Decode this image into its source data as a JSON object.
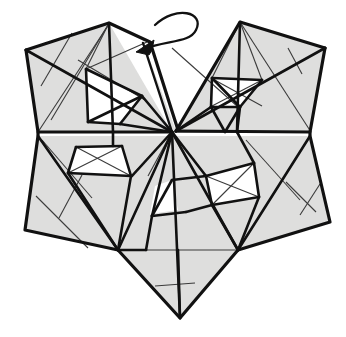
{
  "figure": {
    "kind": "crease-pattern-step",
    "canvas": {
      "width": 346,
      "height": 337
    },
    "colors": {
      "background": "#ffffff",
      "paper_front": "#dededd",
      "paper_pocket": "#ffffff",
      "line_major": "#111111",
      "line_minor": "#3a3a3a",
      "arrow": "#111111"
    },
    "stroke_widths": {
      "outline": 3.2,
      "major": 2.6,
      "minor": 1.1,
      "arrow": 2.4
    },
    "landmarks": {
      "center_vertex": "172,132",
      "left_corner": "26,50",
      "right_corner": "325,48",
      "top_left_peak": "109,23",
      "top_right_peak": "240,22",
      "bottom_left_corner": "25,230",
      "bottom_right_corner": "330,222",
      "bottom_point": "180,318"
    },
    "annotation": {
      "arrow_name": "fold-arrow",
      "arrow_meaning": "valley-fold-flap-left",
      "arrow_start": "186,14",
      "arrow_end": "138,50"
    },
    "shapes": {
      "facets": [
        {
          "name": "upper-left-outer-west",
          "points": "26,50 109,23 113,132 38,132"
        },
        {
          "name": "upper-left-outer-north",
          "points": "109,23 169,130 113,132"
        },
        {
          "name": "upper-left-fan-a",
          "points": "26,50 113,132 38,132"
        },
        {
          "name": "upper-left-inner-pocket-left",
          "points": "86,69 113,94 88,122"
        },
        {
          "name": "upper-left-inner-pocket-right",
          "points": "86,69 142,96 113,94"
        },
        {
          "name": "upper-left-pocket-lower",
          "points": "113,94 142,96 120,124 88,122"
        },
        {
          "name": "upper-right-outer-east",
          "points": "325,48 240,22 236,132 310,132"
        },
        {
          "name": "upper-right-outer-north",
          "points": "240,22 176,130 236,132"
        },
        {
          "name": "upper-right-pocket",
          "points": "212,78 262,80 237,106 212,106"
        },
        {
          "name": "lower-left-outer",
          "points": "38,136 25,230 118,250 172,136"
        },
        {
          "name": "lower-left-pocket",
          "points": "76,146 122,146 130,174 68,172"
        },
        {
          "name": "lower-right-outer",
          "points": "236,136 310,136 330,222 238,250"
        },
        {
          "name": "lower-right-pocket",
          "points": "206,176 252,164 258,196 212,204"
        },
        {
          "name": "bottom-wedge",
          "points": "118,250 180,318 238,250 172,136"
        }
      ]
    }
  }
}
